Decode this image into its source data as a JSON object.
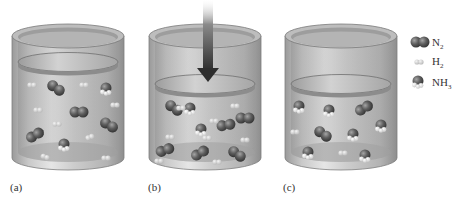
{
  "figure": {
    "panels": [
      {
        "id": "a",
        "caption": "(a)",
        "piston_level": "high",
        "description": "N2 + H2 mixture at original volume"
      },
      {
        "id": "b",
        "caption": "(b)",
        "piston_level": "low",
        "description": "Piston pushed down, volume decreased",
        "arrow": "downward-pressure-arrow"
      },
      {
        "id": "c",
        "caption": "(c)",
        "piston_level": "low",
        "description": "New equilibrium with more NH3"
      }
    ],
    "legend": [
      {
        "species": "N2",
        "label_main": "N",
        "label_sub": "2",
        "icon": "n2-molecule-icon"
      },
      {
        "species": "H2",
        "label_main": "H",
        "label_sub": "2",
        "icon": "h2-molecule-icon"
      },
      {
        "species": "NH3",
        "label_main": "NH",
        "label_sub": "3",
        "icon": "nh3-molecule-icon"
      }
    ],
    "colors": {
      "cylinder": "#b8b8b8",
      "n2": "#5a5a5a",
      "h2": "#cfcfcf",
      "nh3_n": "#666666",
      "nh3_h": "#e0e0e0",
      "arrow": "#3a3a3a"
    }
  }
}
